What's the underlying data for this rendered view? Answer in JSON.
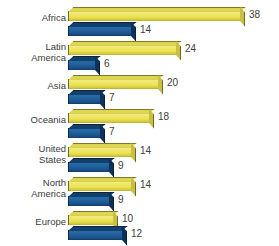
{
  "chart_data": {
    "type": "bar",
    "orientation": "horizontal",
    "grouped": true,
    "title": "",
    "subtitle": "",
    "xlabel": "",
    "ylabel": "",
    "grid": false,
    "legend": null,
    "xlim": [
      0,
      38
    ],
    "categories": [
      "Africa",
      "Latin America",
      "Asia",
      "Oceania",
      "United States",
      "North America",
      "Europe"
    ],
    "series": [
      {
        "name": "yellow-series",
        "color": "#ece34f",
        "values": [
          38,
          24,
          20,
          18,
          14,
          14,
          10
        ]
      },
      {
        "name": "blue-series",
        "color": "#1d5b96",
        "values": [
          14,
          6,
          7,
          7,
          9,
          9,
          12
        ]
      }
    ],
    "rows": [
      {
        "label": "Africa",
        "label_lines": "Africa",
        "yellow": 38,
        "blue": 14
      },
      {
        "label": "Latin America",
        "label_lines": "Latin\nAmerica",
        "yellow": 24,
        "blue": 6
      },
      {
        "label": "Asia",
        "label_lines": "Asia",
        "yellow": 20,
        "blue": 7
      },
      {
        "label": "Oceania",
        "label_lines": "Oceania",
        "yellow": 18,
        "blue": 7
      },
      {
        "label": "United States",
        "label_lines": "United\nStates",
        "yellow": 14,
        "blue": 9
      },
      {
        "label": "North America",
        "label_lines": "North\nAmerica",
        "yellow": 14,
        "blue": 9
      },
      {
        "label": "Europe",
        "label_lines": "Europe",
        "yellow": 10,
        "blue": 12
      }
    ]
  },
  "colors": {
    "yellow": "#ece34f",
    "yellow_dark": "#b3a92f",
    "blue": "#1d5b96",
    "blue_dark": "#0e3760",
    "text": "#3b3b3b",
    "background": "#ffffff"
  }
}
